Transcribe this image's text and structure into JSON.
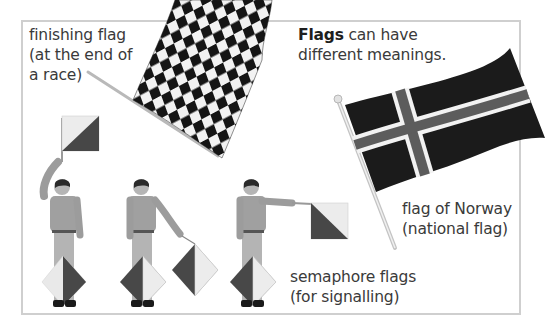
{
  "heading": {
    "bold": "Flags",
    "rest_line1": " can have",
    "line2": "different meanings."
  },
  "captions": {
    "finishing_flag": {
      "line1": "finishing flag",
      "line2": "(at the end of",
      "line3": "a race)"
    },
    "norway_flag": {
      "line1": "flag of Norway",
      "line2": "(national flag)"
    },
    "semaphore_flags": {
      "line1": "semaphore flags",
      "line2": "(for signalling)"
    }
  },
  "colors": {
    "frame_border": "#cfcfcf",
    "flag_dark": "#1c1c1c",
    "flag_cross_mid": "#5a5a5a",
    "semaphore_dark": "#4a4a4a",
    "semaphore_light": "#e8e8e8",
    "clothing": "#9a9a9a"
  }
}
